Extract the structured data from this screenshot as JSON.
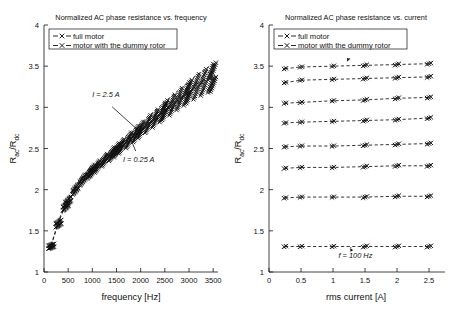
{
  "figure": {
    "kind": "two-panel scientific line plot",
    "background": "#ffffff",
    "foreground": "#111111"
  },
  "legend": {
    "entries": [
      {
        "label": "full motor",
        "marker": "x-marker",
        "line": "dashed"
      },
      {
        "label": "motor with the dummy rotor",
        "marker": "x-marker",
        "line": "dashed"
      }
    ],
    "prefix_left": "-",
    "prefix_right": "-",
    "position": "upper-left inside axes"
  },
  "chart_data": [
    {
      "id": "left",
      "type": "line",
      "title": "Normalized AC phase resistance vs. frequency",
      "xlabel": "frequency [Hz]",
      "ylabel": "R_ac/R_dc",
      "ylabel_parts": {
        "main1": "R",
        "sub1": "ac",
        "slash": "/",
        "main2": "R",
        "sub2": "dc"
      },
      "xlim": [
        0,
        3600
      ],
      "ylim": [
        1,
        4
      ],
      "xticks": [
        0,
        500,
        1000,
        1500,
        2000,
        2500,
        3000,
        3500
      ],
      "xticklabels": [
        "0",
        "500",
        "1000",
        "1500",
        "2000",
        "2500",
        "3000",
        "3500"
      ],
      "yticks": [
        1,
        1.5,
        2,
        2.5,
        3,
        3.5,
        4
      ],
      "yticklabels": [
        "1",
        "1.5",
        "2",
        "2.5",
        "3",
        "3.5",
        "4"
      ],
      "grid": false,
      "legend_position": "upper left",
      "annotations": [
        {
          "text": "I = 2.5 A",
          "x": 1280,
          "y": 3.12,
          "arrow_to_x": 1950,
          "arrow_to_y": 2.72
        },
        {
          "text": "I = 0.25 A",
          "x": 1960,
          "y": 2.33,
          "arrow_to_x": 1760,
          "arrow_to_y": 2.66
        }
      ],
      "x": [
        150,
        300,
        450,
        500,
        650,
        800,
        950,
        1000,
        1100,
        1250,
        1400,
        1500,
        1600,
        1750,
        1900,
        2000,
        2150,
        2300,
        2450,
        2500,
        2650,
        2800,
        2950,
        3000,
        3150,
        3300,
        3450,
        3500
      ],
      "series": [
        {
          "name": "full motor",
          "style": "dashed-x",
          "values": [
            1.33,
            1.62,
            1.84,
            1.9,
            2.05,
            2.17,
            2.26,
            2.29,
            2.34,
            2.42,
            2.5,
            2.55,
            2.6,
            2.68,
            2.76,
            2.81,
            2.89,
            2.96,
            3.04,
            3.07,
            3.14,
            3.22,
            3.29,
            3.32,
            3.39,
            3.45,
            3.51,
            3.53
          ]
        },
        {
          "name": "motor with the dummy rotor",
          "style": "dashed-x",
          "values": [
            1.32,
            1.6,
            1.82,
            1.88,
            2.03,
            2.15,
            2.24,
            2.27,
            2.32,
            2.4,
            2.47,
            2.52,
            2.57,
            2.64,
            2.72,
            2.77,
            2.84,
            2.91,
            2.98,
            3.01,
            3.07,
            3.14,
            3.2,
            3.23,
            3.28,
            3.33,
            3.37,
            3.38
          ]
        }
      ]
    },
    {
      "id": "right",
      "type": "line",
      "title": "Normalized AC phase resistance vs. current",
      "xlabel": "rms current [A]",
      "ylabel": "R_ac/R_dc",
      "ylabel_parts": {
        "main1": "R",
        "sub1": "ac",
        "slash": "/",
        "main2": "R",
        "sub2": "dc"
      },
      "xlim": [
        0,
        2.75
      ],
      "ylim": [
        1,
        4
      ],
      "xticks": [
        0,
        0.5,
        1,
        1.5,
        2,
        2.5
      ],
      "xticklabels": [
        "0",
        "0.5",
        "1",
        "1.5",
        "2",
        "2.5"
      ],
      "yticks": [
        1,
        1.5,
        2,
        2.5,
        3,
        3.5,
        4
      ],
      "yticklabels": [
        "1",
        "1.5",
        "2",
        "2.5",
        "3",
        "3.5",
        "4"
      ],
      "grid": false,
      "legend_position": "upper left",
      "annotations": [
        {
          "text": "f = 3500 Hz",
          "x": 1.33,
          "y": 3.73,
          "arrow_to_x": 1.22,
          "arrow_to_y": 3.56
        },
        {
          "text": "f = 100 Hz",
          "x": 1.35,
          "y": 1.17,
          "arrow_to_x": 1.27,
          "arrow_to_y": 1.29
        }
      ],
      "x": [
        0.25,
        0.5,
        1.0,
        1.5,
        2.0,
        2.5
      ],
      "series": [
        {
          "name": "3500 Hz full motor",
          "frequency_hz": 3500,
          "style": "dashed-x",
          "values": [
            3.47,
            3.49,
            3.5,
            3.51,
            3.52,
            3.53
          ]
        },
        {
          "name": "3500 Hz dummy rotor",
          "frequency_hz": 3500,
          "style": "dashed-x",
          "values": [
            3.3,
            3.33,
            3.34,
            3.35,
            3.36,
            3.37
          ]
        },
        {
          "name": "3000 Hz",
          "frequency_hz": 3000,
          "style": "dashed-x",
          "values": [
            3.05,
            3.06,
            3.08,
            3.09,
            3.11,
            3.12
          ]
        },
        {
          "name": "2500 Hz",
          "frequency_hz": 2500,
          "style": "dashed-x",
          "values": [
            2.81,
            2.82,
            2.83,
            2.84,
            2.85,
            2.87
          ]
        },
        {
          "name": "2000 Hz",
          "frequency_hz": 2000,
          "style": "dashed-x",
          "values": [
            2.52,
            2.53,
            2.53,
            2.54,
            2.55,
            2.56
          ]
        },
        {
          "name": "1500 Hz",
          "frequency_hz": 1500,
          "style": "dashed-x",
          "values": [
            2.26,
            2.27,
            2.27,
            2.28,
            2.29,
            2.29
          ]
        },
        {
          "name": "1000 Hz",
          "frequency_hz": 1000,
          "style": "dashed-x",
          "values": [
            1.9,
            1.91,
            1.91,
            1.91,
            1.92,
            1.92
          ]
        },
        {
          "name": "100 Hz",
          "frequency_hz": 100,
          "style": "dashed-x",
          "values": [
            1.31,
            1.31,
            1.31,
            1.31,
            1.31,
            1.31
          ]
        }
      ]
    }
  ]
}
